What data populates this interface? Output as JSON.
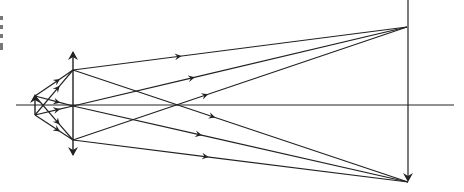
{
  "diagram": {
    "canvas": {
      "width": 464,
      "height": 192,
      "background": "#ffffff",
      "stroke": "#222222"
    },
    "optical_axis": {
      "x1": 16,
      "x2": 454,
      "y": 105
    },
    "lens": {
      "x": 73,
      "top": 52,
      "bottom": 155,
      "top_arrow": "up",
      "bottom_arrow": "down"
    },
    "object": {
      "x": 35,
      "top": 96,
      "bottom": 115,
      "arrow": "up"
    },
    "image": {
      "x": 408,
      "top": 0,
      "bottom": 182,
      "arrow": "down"
    },
    "lens_points": [
      {
        "name": "upper",
        "x": 73,
        "y": 70
      },
      {
        "name": "center",
        "x": 73,
        "y": 106
      },
      {
        "name": "lower",
        "x": 73,
        "y": 140
      }
    ],
    "convergence": {
      "from_object_top": {
        "x": 408,
        "y": 182
      },
      "from_object_bottom": {
        "x": 407,
        "y": 27
      }
    },
    "edge_marks": [
      "",
      "",
      "",
      ""
    ]
  }
}
